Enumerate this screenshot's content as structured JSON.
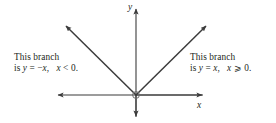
{
  "figure": {
    "background_color": "#ffffff",
    "stroke_color": "#3b3b3b",
    "text_color": "#231f20"
  },
  "axes": {
    "x_label": "x",
    "y_label": "y",
    "origin_marker": "open-circle",
    "x_axis": {
      "from_x": 58,
      "to_x": 202,
      "y": 95,
      "arrows": "both"
    },
    "y_axis": {
      "x": 136,
      "from_y": 8,
      "to_y": 117,
      "arrows": "both"
    }
  },
  "branches": [
    {
      "name": "left-branch",
      "equation_prefix": "is ",
      "equation_var": "y",
      "equation_body": " = −",
      "equation_x": "x",
      "equation_tail": ", ",
      "condition_var": "x",
      "condition_tail": " < 0.",
      "heading": "This branch",
      "slope": -1,
      "from": {
        "x": 136,
        "y": 95
      },
      "to": {
        "x": 65,
        "y": 25
      },
      "arrow_at": "end"
    },
    {
      "name": "right-branch",
      "equation_prefix": "is ",
      "equation_var": "y",
      "equation_body": " = ",
      "equation_x": "x",
      "equation_tail": ", ",
      "condition_var": "x",
      "condition_tail": " ⩾ 0.",
      "heading": "This branch",
      "slope": 1,
      "from": {
        "x": 136,
        "y": 95
      },
      "to": {
        "x": 207,
        "y": 25
      },
      "arrow_at": "end"
    }
  ],
  "captions": {
    "left": {
      "line1": "This branch",
      "line2_prefix": "is ",
      "line2_var1": "y",
      "line2_mid": " = −",
      "line2_var2": "x",
      "line2_comma": ",  ",
      "line2_var3": "x",
      "line2_end": " < 0."
    },
    "right": {
      "line1": "This branch",
      "line2_prefix": "is ",
      "line2_var1": "y",
      "line2_mid": " = ",
      "line2_var2": "x",
      "line2_comma": ",  ",
      "line2_var3": "x",
      "line2_end": " ⩾ 0."
    }
  }
}
